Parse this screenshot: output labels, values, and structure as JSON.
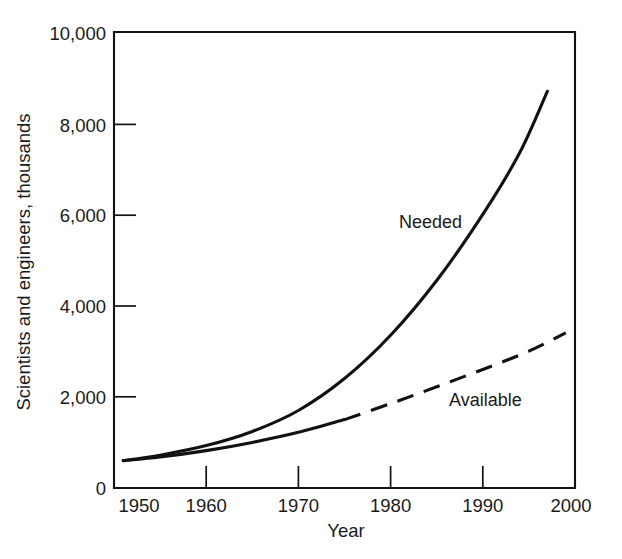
{
  "chart_data": {
    "type": "line",
    "title": "",
    "xlabel": "Year",
    "ylabel": "Scientists and engineers, thousands",
    "xlim": [
      1950,
      2000
    ],
    "ylim": [
      0,
      10000
    ],
    "grid": false,
    "legend_position": "inline-annotations",
    "x_ticks": [
      1950,
      1960,
      1970,
      1980,
      1990,
      2000
    ],
    "x_tick_labels": [
      "1950",
      "1960",
      "1970",
      "1980",
      "1990",
      "2000"
    ],
    "y_ticks": [
      0,
      2000,
      4000,
      6000,
      8000,
      10000
    ],
    "y_tick_labels": [
      "0",
      "2,000",
      "4,000",
      "6,000",
      "8,000",
      "10,000"
    ],
    "series": [
      {
        "name": "Needed",
        "style": "solid",
        "annotation": "Needed",
        "x": [
          1951,
          1955,
          1960,
          1965,
          1970,
          1975,
          1980,
          1985,
          1990,
          1994,
          1997
        ],
        "values": [
          600,
          720,
          930,
          1240,
          1700,
          2400,
          3350,
          4550,
          6000,
          7350,
          8700
        ]
      },
      {
        "name": "Available",
        "style": "solid-then-dashed",
        "annotation": "Available",
        "dash_start_year": 1975,
        "x": [
          1951,
          1955,
          1960,
          1965,
          1970,
          1975,
          1980,
          1985,
          1990,
          1995,
          1999
        ],
        "values": [
          600,
          680,
          820,
          1000,
          1220,
          1500,
          1850,
          2220,
          2600,
          3000,
          3400
        ]
      }
    ],
    "annotations": [
      {
        "text": "Needed",
        "x_year": 1981.5,
        "y_value": 5950
      },
      {
        "text": "Available",
        "x_year": 1986.5,
        "y_value": 2070
      }
    ]
  }
}
